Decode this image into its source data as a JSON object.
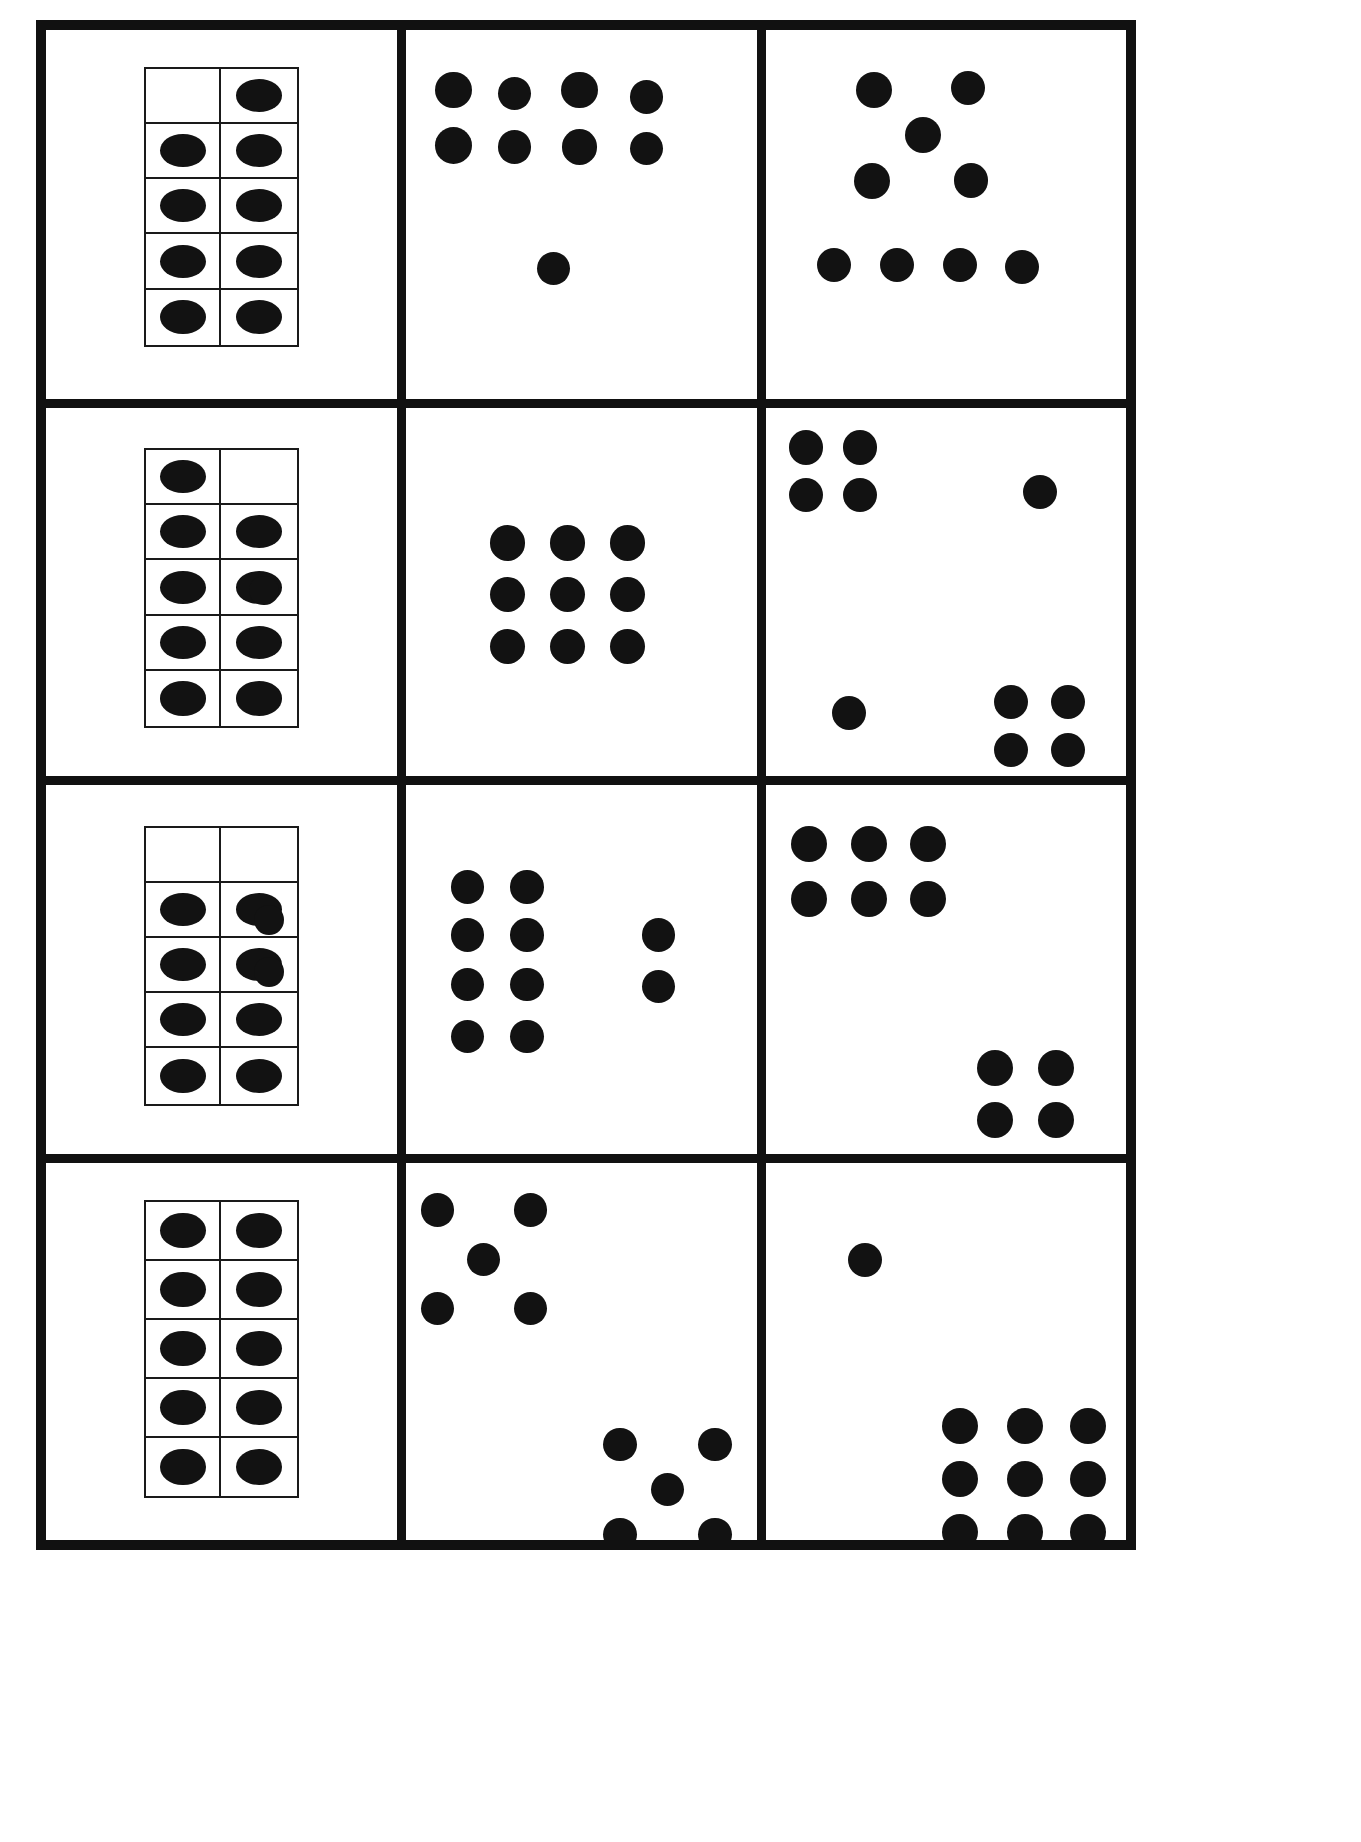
{
  "page": {
    "width": 1361,
    "height": 1842,
    "background_color": "#ffffff",
    "ink_color": "#121212",
    "border_color": "#111111",
    "grid": {
      "rows": 4,
      "columns": 3
    }
  },
  "cells": [
    {
      "id": "r1c1",
      "row": 1,
      "column": 1,
      "kind": "ten-frame",
      "total_dots": 9,
      "ten_frame": {
        "columns": 2,
        "rows": 5,
        "filled": [
          [
            false,
            true
          ],
          [
            true,
            true
          ],
          [
            true,
            true
          ],
          [
            true,
            true
          ],
          [
            true,
            true
          ]
        ],
        "filled_count": 9,
        "empty_count": 1
      },
      "loose_dots": 0
    },
    {
      "id": "r1c2",
      "row": 1,
      "column": 2,
      "kind": "free-arrangement",
      "total_dots": 9,
      "groups": [
        {
          "name": "array-4-by-2",
          "count": 8,
          "shape": "4 columns x 2 rows"
        },
        {
          "name": "single-dot",
          "count": 1,
          "shape": "isolated below array"
        }
      ]
    },
    {
      "id": "r1c3",
      "row": 1,
      "column": 3,
      "kind": "free-arrangement",
      "total_dots": 9,
      "groups": [
        {
          "name": "diamond-cluster",
          "count": 5,
          "shape": "2 top, 1 middle, 2 lower"
        },
        {
          "name": "row-of-four",
          "count": 4,
          "shape": "horizontal row"
        }
      ]
    },
    {
      "id": "r2c1",
      "row": 2,
      "column": 1,
      "kind": "ten-frame-plus-loose",
      "total_dots": 10,
      "ten_frame": {
        "columns": 2,
        "rows": 5,
        "filled": [
          [
            true,
            false
          ],
          [
            true,
            true
          ],
          [
            true,
            true
          ],
          [
            true,
            true
          ],
          [
            true,
            true
          ]
        ],
        "filled_count": 9,
        "empty_count": 1
      },
      "loose_dots": 1
    },
    {
      "id": "r2c2",
      "row": 2,
      "column": 2,
      "kind": "free-arrangement",
      "total_dots": 9,
      "groups": [
        {
          "name": "array-3-by-3",
          "count": 9,
          "shape": "3 columns x 3 rows"
        }
      ]
    },
    {
      "id": "r2c3",
      "row": 2,
      "column": 3,
      "kind": "free-arrangement",
      "total_dots": 10,
      "groups": [
        {
          "name": "square-top-left",
          "count": 4,
          "shape": "2 x 2"
        },
        {
          "name": "single-top-right",
          "count": 1,
          "shape": "isolated"
        },
        {
          "name": "single-bottom-left",
          "count": 1,
          "shape": "isolated"
        },
        {
          "name": "square-bottom-right",
          "count": 4,
          "shape": "2 x 2"
        }
      ]
    },
    {
      "id": "r3c1",
      "row": 3,
      "column": 1,
      "kind": "ten-frame-plus-loose",
      "total_dots": 10,
      "ten_frame": {
        "columns": 2,
        "rows": 5,
        "filled": [
          [
            false,
            false
          ],
          [
            true,
            true
          ],
          [
            true,
            true
          ],
          [
            true,
            true
          ],
          [
            true,
            true
          ]
        ],
        "filled_count": 8,
        "empty_count": 2
      },
      "loose_dots": 2
    },
    {
      "id": "r3c2",
      "row": 3,
      "column": 2,
      "kind": "free-arrangement",
      "total_dots": 10,
      "groups": [
        {
          "name": "array-2-by-4",
          "count": 8,
          "shape": "2 columns x 4 rows"
        },
        {
          "name": "pair-right",
          "count": 2,
          "shape": "vertical pair"
        }
      ]
    },
    {
      "id": "r3c3",
      "row": 3,
      "column": 3,
      "kind": "free-arrangement",
      "total_dots": 10,
      "groups": [
        {
          "name": "array-3-by-2-top-left",
          "count": 6,
          "shape": "3 columns x 2 rows"
        },
        {
          "name": "square-bottom-right",
          "count": 4,
          "shape": "2 x 2"
        }
      ]
    },
    {
      "id": "r4c1",
      "row": 4,
      "column": 1,
      "kind": "ten-frame",
      "total_dots": 10,
      "ten_frame": {
        "columns": 2,
        "rows": 5,
        "filled": [
          [
            true,
            true
          ],
          [
            true,
            true
          ],
          [
            true,
            true
          ],
          [
            true,
            true
          ],
          [
            true,
            true
          ]
        ],
        "filled_count": 10,
        "empty_count": 0
      },
      "loose_dots": 0
    },
    {
      "id": "r4c2",
      "row": 4,
      "column": 2,
      "kind": "free-arrangement",
      "total_dots": 10,
      "groups": [
        {
          "name": "scatter-quincunx-top-left",
          "count": 5,
          "shape": "dice-five scatter"
        },
        {
          "name": "scatter-quincunx-bottom-right",
          "count": 5,
          "shape": "dice-five scatter"
        }
      ]
    },
    {
      "id": "r4c3",
      "row": 4,
      "column": 3,
      "kind": "free-arrangement",
      "total_dots": 10,
      "groups": [
        {
          "name": "single-top",
          "count": 1,
          "shape": "isolated"
        },
        {
          "name": "array-3-by-3-bottom-right",
          "count": 9,
          "shape": "3 columns x 3 rows"
        }
      ]
    }
  ],
  "dot_layouts": {
    "r1c2": [
      {
        "x": 13.5,
        "y": 15.5,
        "d": 10.5
      },
      {
        "x": 31.0,
        "y": 16.5,
        "d": 9.5
      },
      {
        "x": 49.5,
        "y": 15.5,
        "d": 10.5
      },
      {
        "x": 68.5,
        "y": 17.5,
        "d": 9.5
      },
      {
        "x": 13.5,
        "y": 30.5,
        "d": 10.5
      },
      {
        "x": 31.0,
        "y": 31.0,
        "d": 9.5
      },
      {
        "x": 49.5,
        "y": 31.0,
        "d": 10.0
      },
      {
        "x": 68.5,
        "y": 31.5,
        "d": 9.5
      },
      {
        "x": 42.0,
        "y": 64.0,
        "d": 9.5
      }
    ],
    "r1c3": [
      {
        "x": 30.0,
        "y": 15.5,
        "d": 10.0
      },
      {
        "x": 56.0,
        "y": 15.0,
        "d": 9.5
      },
      {
        "x": 43.5,
        "y": 27.5,
        "d": 10.0
      },
      {
        "x": 29.5,
        "y": 40.0,
        "d": 10.0
      },
      {
        "x": 57.0,
        "y": 40.0,
        "d": 9.5
      },
      {
        "x": 19.0,
        "y": 63.0,
        "d": 9.5
      },
      {
        "x": 36.5,
        "y": 63.0,
        "d": 9.5
      },
      {
        "x": 54.0,
        "y": 63.0,
        "d": 9.5
      },
      {
        "x": 71.0,
        "y": 63.5,
        "d": 9.5
      }
    ],
    "r2c1_loose": [
      {
        "x": 62.0,
        "y": 49.0,
        "d": 8.5
      }
    ],
    "r2c2": [
      {
        "x": 29.0,
        "y": 36.0,
        "d": 10.0
      },
      {
        "x": 46.0,
        "y": 36.0,
        "d": 10.0
      },
      {
        "x": 63.0,
        "y": 36.0,
        "d": 10.0
      },
      {
        "x": 29.0,
        "y": 50.0,
        "d": 10.0
      },
      {
        "x": 46.0,
        "y": 50.0,
        "d": 10.0
      },
      {
        "x": 63.0,
        "y": 50.0,
        "d": 10.0
      },
      {
        "x": 29.0,
        "y": 64.0,
        "d": 10.0
      },
      {
        "x": 46.0,
        "y": 64.0,
        "d": 10.0
      },
      {
        "x": 63.0,
        "y": 64.0,
        "d": 10.0
      }
    ],
    "r2c3": [
      {
        "x": 11.0,
        "y": 10.0,
        "d": 9.5
      },
      {
        "x": 26.0,
        "y": 10.0,
        "d": 9.5
      },
      {
        "x": 11.0,
        "y": 23.0,
        "d": 9.5
      },
      {
        "x": 26.0,
        "y": 23.0,
        "d": 9.5
      },
      {
        "x": 76.0,
        "y": 22.0,
        "d": 9.5
      },
      {
        "x": 23.0,
        "y": 82.0,
        "d": 9.5
      },
      {
        "x": 68.0,
        "y": 79.0,
        "d": 9.5
      },
      {
        "x": 84.0,
        "y": 79.0,
        "d": 9.5
      },
      {
        "x": 68.0,
        "y": 92.0,
        "d": 9.5
      },
      {
        "x": 84.0,
        "y": 92.0,
        "d": 9.5
      }
    ],
    "r3c1_loose": [
      {
        "x": 63.5,
        "y": 36.0,
        "d": 8.5
      },
      {
        "x": 63.5,
        "y": 50.0,
        "d": 8.5
      }
    ],
    "r3c2": [
      {
        "x": 17.5,
        "y": 27.0,
        "d": 9.5
      },
      {
        "x": 34.5,
        "y": 27.0,
        "d": 9.5
      },
      {
        "x": 17.5,
        "y": 40.0,
        "d": 9.5
      },
      {
        "x": 34.5,
        "y": 40.0,
        "d": 9.5
      },
      {
        "x": 17.5,
        "y": 53.5,
        "d": 9.5
      },
      {
        "x": 34.5,
        "y": 53.5,
        "d": 9.5
      },
      {
        "x": 17.5,
        "y": 67.5,
        "d": 9.5
      },
      {
        "x": 34.5,
        "y": 67.5,
        "d": 9.5
      },
      {
        "x": 72.0,
        "y": 40.0,
        "d": 9.5
      },
      {
        "x": 72.0,
        "y": 54.0,
        "d": 9.5
      }
    ],
    "r3c3": [
      {
        "x": 12.0,
        "y": 15.0,
        "d": 10.0
      },
      {
        "x": 28.5,
        "y": 15.0,
        "d": 10.0
      },
      {
        "x": 45.0,
        "y": 15.0,
        "d": 10.0
      },
      {
        "x": 12.0,
        "y": 30.0,
        "d": 10.0
      },
      {
        "x": 28.5,
        "y": 30.0,
        "d": 10.0
      },
      {
        "x": 45.0,
        "y": 30.0,
        "d": 10.0
      },
      {
        "x": 63.5,
        "y": 76.0,
        "d": 10.0
      },
      {
        "x": 80.5,
        "y": 76.0,
        "d": 10.0
      },
      {
        "x": 63.5,
        "y": 90.0,
        "d": 10.0
      },
      {
        "x": 80.5,
        "y": 90.0,
        "d": 10.0
      }
    ],
    "r4c2": [
      {
        "x": 9.0,
        "y": 12.0,
        "d": 9.5
      },
      {
        "x": 35.5,
        "y": 12.0,
        "d": 9.5
      },
      {
        "x": 22.0,
        "y": 25.0,
        "d": 9.5
      },
      {
        "x": 9.0,
        "y": 38.0,
        "d": 9.5
      },
      {
        "x": 35.5,
        "y": 38.0,
        "d": 9.5
      },
      {
        "x": 61.0,
        "y": 74.0,
        "d": 9.5
      },
      {
        "x": 88.0,
        "y": 74.0,
        "d": 9.5
      },
      {
        "x": 74.5,
        "y": 86.0,
        "d": 9.5
      },
      {
        "x": 61.0,
        "y": 98.0,
        "d": 9.5
      },
      {
        "x": 88.0,
        "y": 98.0,
        "d": 9.5
      }
    ],
    "r4c3": [
      {
        "x": 27.5,
        "y": 25.0,
        "d": 9.5
      },
      {
        "x": 54.0,
        "y": 69.0,
        "d": 10.0
      },
      {
        "x": 72.0,
        "y": 69.0,
        "d": 10.0
      },
      {
        "x": 89.5,
        "y": 69.0,
        "d": 10.0
      },
      {
        "x": 54.0,
        "y": 83.0,
        "d": 10.0
      },
      {
        "x": 72.0,
        "y": 83.0,
        "d": 10.0
      },
      {
        "x": 89.5,
        "y": 83.0,
        "d": 10.0
      },
      {
        "x": 54.0,
        "y": 97.0,
        "d": 10.0
      },
      {
        "x": 72.0,
        "y": 97.0,
        "d": 10.0
      },
      {
        "x": 89.5,
        "y": 97.0,
        "d": 10.0
      }
    ]
  },
  "ten_frame_geometry": {
    "r1c1": {
      "left": 28.0,
      "top": 10.0,
      "width": 44.0,
      "height": 76.0
    },
    "r2c1": {
      "left": 28.0,
      "top": 11.0,
      "width": 44.0,
      "height": 76.0
    },
    "r3c1": {
      "left": 28.0,
      "top": 11.0,
      "width": 44.0,
      "height": 76.0
    },
    "r4c1": {
      "left": 28.0,
      "top": 10.0,
      "width": 44.0,
      "height": 79.0
    }
  }
}
